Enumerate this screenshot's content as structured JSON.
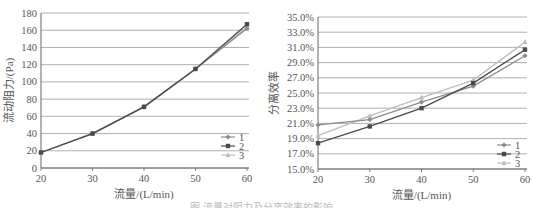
{
  "chart_data": [
    {
      "type": "line",
      "title": "",
      "xlabel": "流量/(L/min)",
      "ylabel": "流动阻力/(Pa)",
      "x": [
        20,
        30,
        40,
        50,
        60
      ],
      "xticks": [
        "20",
        "30",
        "40",
        "50",
        "60"
      ],
      "yticks": [
        "0",
        "20",
        "40",
        "60",
        "80",
        "100",
        "120",
        "140",
        "160",
        "180"
      ],
      "ylim": [
        0,
        180
      ],
      "xlim": [
        20,
        60
      ],
      "grid": true,
      "legend_position": "lower-right",
      "series": [
        {
          "name": "1",
          "values": [
            18,
            40,
            71,
            115,
            162
          ],
          "color": "#8c8c8c",
          "marker": "diamond"
        },
        {
          "name": "2",
          "values": [
            18,
            40,
            71,
            115,
            167
          ],
          "color": "#4a4a4a",
          "marker": "square"
        },
        {
          "name": "3",
          "values": [
            18,
            40,
            71,
            115,
            164
          ],
          "color": "#bdbdbd",
          "marker": "triangle"
        }
      ]
    },
    {
      "type": "line",
      "title": "",
      "xlabel": "流量/(L/min)",
      "ylabel": "分离效率",
      "x": [
        20,
        30,
        40,
        50,
        60
      ],
      "xticks": [
        "20",
        "30",
        "40",
        "50",
        "60"
      ],
      "yticks": [
        "15.0%",
        "17.0%",
        "19.0%",
        "21.0%",
        "23.0%",
        "25.0%",
        "27.0%",
        "29.0%",
        "31.0%",
        "33.0%",
        "35.0%"
      ],
      "ylim": [
        15,
        35
      ],
      "xlim": [
        20,
        60
      ],
      "grid": true,
      "legend_position": "lower-right",
      "series": [
        {
          "name": "1",
          "values": [
            20.8,
            21.5,
            23.8,
            25.9,
            29.9
          ],
          "color": "#8c8c8c",
          "marker": "diamond"
        },
        {
          "name": "2",
          "values": [
            18.4,
            20.6,
            23.0,
            26.3,
            30.7
          ],
          "color": "#4a4a4a",
          "marker": "square"
        },
        {
          "name": "3",
          "values": [
            19.4,
            22.0,
            24.4,
            26.7,
            31.7
          ],
          "color": "#bdbdbd",
          "marker": "triangle"
        }
      ]
    }
  ],
  "caption": "图 流量对阻力及分离效率的影响"
}
